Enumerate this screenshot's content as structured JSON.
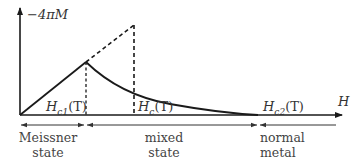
{
  "diagram": {
    "type": "magnetization-curve",
    "y_axis_label": "−4πM",
    "x_axis_label": "H",
    "markers": [
      {
        "id": "hc1",
        "label_main": "H",
        "label_sub": "c1",
        "label_arg": "(T)"
      },
      {
        "id": "hc",
        "label_main": "H",
        "label_sub": "c",
        "label_arg": "(T)"
      },
      {
        "id": "hc2",
        "label_main": "H",
        "label_sub": "c2",
        "label_arg": "(T)"
      }
    ],
    "regions": [
      {
        "id": "meissner",
        "line1": "Meissner",
        "line2": "state"
      },
      {
        "id": "mixed",
        "line1": "mixed",
        "line2": "state"
      },
      {
        "id": "normal",
        "line1": "normal",
        "line2": "metal"
      }
    ],
    "colors": {
      "line": "#1a1a1a",
      "axis": "#333333",
      "text": "#333333"
    }
  }
}
